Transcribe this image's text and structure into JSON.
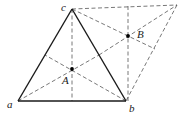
{
  "diagram": {
    "vertices": {
      "a": {
        "label": "a",
        "x": 18,
        "y": 101
      },
      "b": {
        "label": "b",
        "x": 126,
        "y": 101
      },
      "c": {
        "label": "c",
        "x": 72,
        "y": 9
      },
      "d": {
        "label": "",
        "x": 177,
        "y": 5
      }
    },
    "points": {
      "A": {
        "label": "A",
        "x": 72,
        "y": 69
      },
      "B": {
        "label": "B",
        "x": 128,
        "y": 36
      }
    },
    "colors": {
      "solid": "#1a1a1a",
      "dashed": "#555555",
      "background": "#ffffff"
    }
  }
}
